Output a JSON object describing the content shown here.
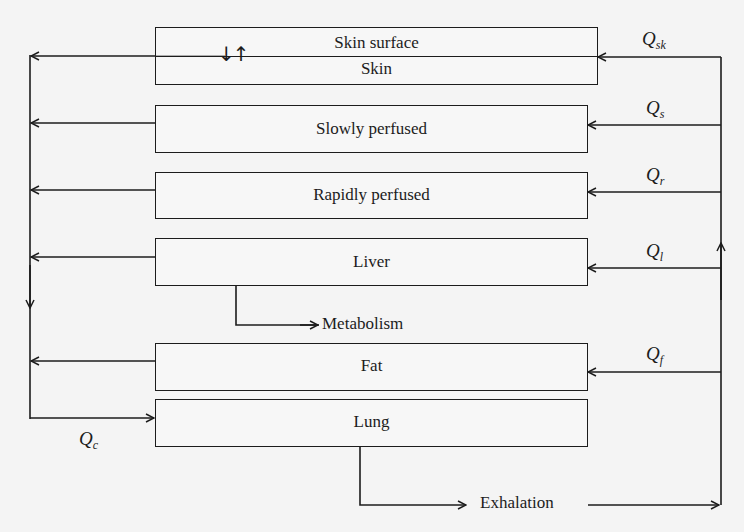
{
  "figure": {
    "type": "PBPK compartment flow diagram",
    "compartments": [
      {
        "id": "skin",
        "label_top": "Skin surface",
        "label_bottom": "Skin"
      },
      {
        "id": "slowly-perfused",
        "label": "Slowly perfused"
      },
      {
        "id": "rapidly-perfused",
        "label": "Rapidly perfused"
      },
      {
        "id": "liver",
        "label": "Liver"
      },
      {
        "id": "fat",
        "label": "Fat"
      },
      {
        "id": "lung",
        "label": "Lung"
      }
    ],
    "outputs": {
      "metabolism": "Metabolism",
      "exhalation": "Exhalation"
    },
    "flows": {
      "skin": {
        "symbol": "Q",
        "sub": "sk"
      },
      "slowly": {
        "symbol": "Q",
        "sub": "s"
      },
      "rapidly": {
        "symbol": "Q",
        "sub": "r"
      },
      "liver": {
        "symbol": "Q",
        "sub": "l"
      },
      "fat": {
        "symbol": "Q",
        "sub": "f"
      },
      "cardiac": {
        "symbol": "Q",
        "sub": "c"
      }
    },
    "skin_exchange_arrows": "↓↑"
  },
  "colors": {
    "line": "#1c1c1c",
    "background": "#f4f4f4"
  }
}
